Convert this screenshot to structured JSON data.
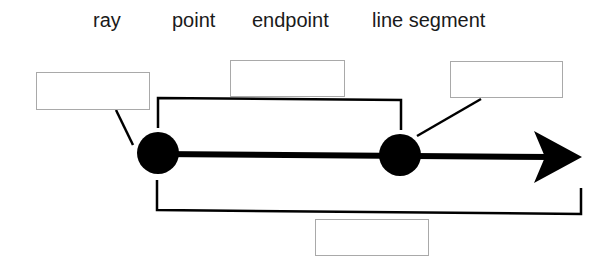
{
  "word_bank": [
    {
      "label": "ray",
      "x": 93
    },
    {
      "label": "point",
      "x": 172
    },
    {
      "label": "endpoint",
      "x": 252
    },
    {
      "label": "line segment",
      "x": 372
    }
  ],
  "answer_boxes": [
    {
      "id": "box-left",
      "x": 36,
      "y": 72,
      "w": 114,
      "h": 38,
      "value": ""
    },
    {
      "id": "box-top",
      "x": 230,
      "y": 60,
      "w": 115,
      "h": 37,
      "value": ""
    },
    {
      "id": "box-right",
      "x": 450,
      "y": 61,
      "w": 113,
      "h": 37,
      "value": ""
    },
    {
      "id": "box-bottom",
      "x": 315,
      "y": 219,
      "w": 114,
      "h": 37,
      "value": ""
    }
  ],
  "figure": {
    "stroke_color": "#000000",
    "box_border_color": "#a9a9a9",
    "point_a": {
      "cx": 158,
      "cy": 153,
      "r": 21
    },
    "point_b": {
      "cx": 400,
      "cy": 155,
      "r": 21
    },
    "ray_line": {
      "x1": 158,
      "y1": 154,
      "x2": 550,
      "y2": 157,
      "width": 6
    },
    "arrowhead": "534,131 582,157 534,183 545,157",
    "top_bracket": "158,128 158,98 401,100 401,130",
    "bottom_bracket": "157,180 157,210 581,214 581,188",
    "leader_left": {
      "x1": 116,
      "y1": 110,
      "x2": 133,
      "y2": 145
    },
    "leader_right": {
      "x1": 481,
      "y1": 99,
      "x2": 417,
      "y2": 136
    }
  }
}
